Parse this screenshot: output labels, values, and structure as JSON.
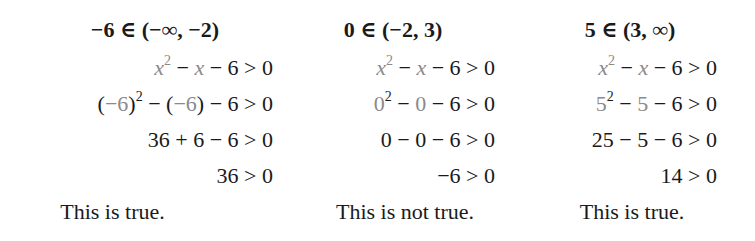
{
  "columns": [
    {
      "heading": {
        "value": "−6",
        "member": " ∈ ",
        "interval": "(−∞, −2)"
      },
      "rows": {
        "expr": {
          "a": "x",
          "exp": "2",
          "op1": " − ",
          "b": "x",
          "rest": " − 6 > 0"
        },
        "substituted": {
          "lp1": "(",
          "a": "−6",
          "rp1": ")",
          "exp": "2",
          "op1": " − (",
          "b": "−6",
          "rp2": ")",
          "rest": " − 6 > 0"
        },
        "simplified": "36 + 6 − 6 > 0",
        "result": "36 > 0"
      },
      "conclusion": "This is true."
    },
    {
      "heading": {
        "value": "0",
        "member": " ∈ ",
        "interval": "(−2, 3)"
      },
      "rows": {
        "expr": {
          "a": "x",
          "exp": "2",
          "op1": " − ",
          "b": "x",
          "rest": " − 6 > 0"
        },
        "substituted": {
          "a": "0",
          "exp": "2",
          "op1": " − ",
          "b": "0",
          "rest": " − 6 > 0"
        },
        "simplified": "0 − 0 − 6 > 0",
        "result": "−6 > 0"
      },
      "conclusion": "This is not true."
    },
    {
      "heading": {
        "value": "5",
        "member": " ∈ ",
        "interval": "(3, ∞)"
      },
      "rows": {
        "expr": {
          "a": "x",
          "exp": "2",
          "op1": " − ",
          "b": "x",
          "rest": " − 6 > 0"
        },
        "substituted": {
          "a": "5",
          "exp": "2",
          "op1": " − ",
          "b": "5",
          "rest": " − 6 > 0"
        },
        "simplified": "25 − 5 − 6 > 0",
        "result": "14 > 0"
      },
      "conclusion": "This is true."
    }
  ],
  "colors": {
    "text": "#1a1a1a",
    "substitution_gray": "#8a8a8a",
    "background": "#ffffff"
  }
}
